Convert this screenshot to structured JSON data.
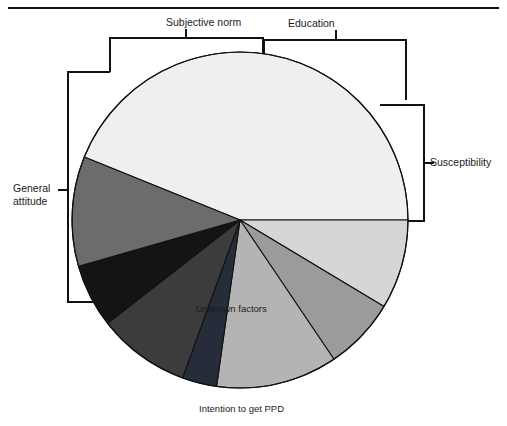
{
  "figure": {
    "top_rule": true,
    "bottom_label": "Intention to get PPD",
    "inner_label": "Unknown factors",
    "bracket_labels": {
      "subjective_norm": "Subjective norm",
      "education": "Education",
      "susceptibility": "Susceptibility",
      "general_attitude_line1": "General",
      "general_attitude_line2": "attitude"
    }
  },
  "chart_data": {
    "type": "pie",
    "title": "",
    "subtitle": "",
    "xlabel": "",
    "ylabel": "",
    "legend_position": "annotations-with-brackets",
    "grid": false,
    "center": {
      "cx": 240,
      "cy": 220,
      "r": 168
    },
    "start_angle_deg": 0,
    "direction": "counterclockwise",
    "labels": [
      "Unknown factors",
      "Susceptibility A",
      "Susceptibility B",
      "Education",
      "Subjective norm A",
      "Subjective norm B",
      "General attitude"
    ],
    "values": [
      44,
      8,
      7,
      13,
      4,
      9,
      15
    ],
    "colors": [
      "#eeeeee",
      "#d4d4d4",
      "#9a9a9a",
      "#b6b6b6",
      "#262b38",
      "#3b3b3b",
      "#151515",
      "#6d6d6d"
    ],
    "slices": [
      {
        "name": "Unknown factors",
        "start_deg": 0,
        "end_deg": 158,
        "color": "#efefef",
        "group": "Intention to get PPD"
      },
      {
        "name": "Susceptibility outer",
        "start_deg": 329,
        "end_deg": 360,
        "color": "#d6d6d6",
        "group": "Susceptibility"
      },
      {
        "name": "Susceptibility inner",
        "start_deg": 304,
        "end_deg": 329,
        "color": "#9b9b9b",
        "group": "Susceptibility"
      },
      {
        "name": "Education",
        "start_deg": 262,
        "end_deg": 304,
        "color": "#b4b4b4",
        "group": "Education"
      },
      {
        "name": "Subjective norm dark",
        "start_deg": 250,
        "end_deg": 262,
        "color": "#262c3a",
        "group": "Subjective norm"
      },
      {
        "name": "Subjective norm gray",
        "start_deg": 218,
        "end_deg": 250,
        "color": "#3c3c3c",
        "group": "Subjective norm"
      },
      {
        "name": "Subjective norm black",
        "start_deg": 196,
        "end_deg": 218,
        "color": "#141414",
        "group": "Subjective norm"
      },
      {
        "name": "General attitude",
        "start_deg": 158,
        "end_deg": 196,
        "color": "#6c6c6c",
        "group": "General attitude"
      }
    ],
    "percentages": [
      43.9,
      8.6,
      6.9,
      11.7,
      3.3,
      8.9,
      6.1,
      10.6
    ]
  }
}
